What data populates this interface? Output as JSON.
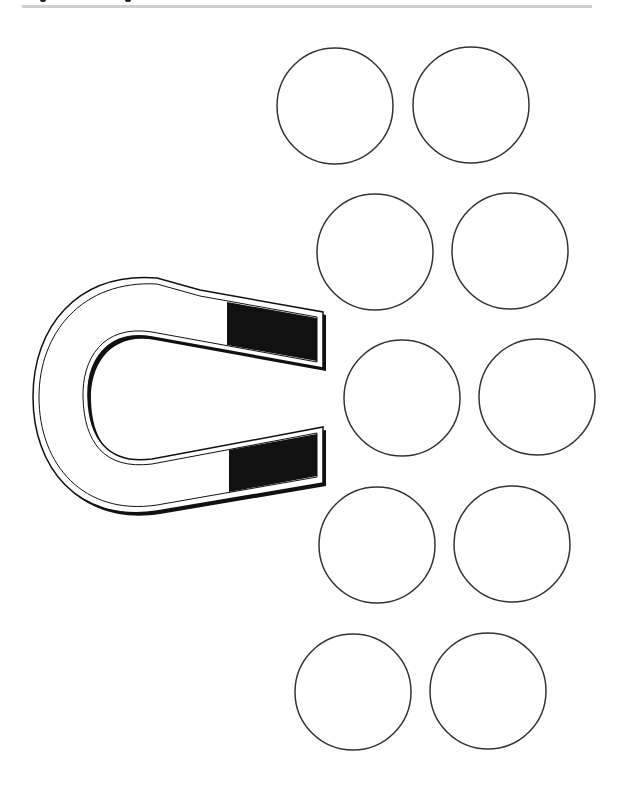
{
  "page": {
    "kind": "worksheet",
    "header_rule_color": "#d0d0d0",
    "ink_color": "#111111",
    "background": "#ffffff"
  },
  "magnet": {
    "name": "horseshoe-magnet",
    "pole_fill": "#111111",
    "body_fill": "#ffffff"
  },
  "circles": {
    "count": 10,
    "stroke": "#333333",
    "fill": "#ffffff",
    "arrangement": "5 rows x 2 columns"
  }
}
